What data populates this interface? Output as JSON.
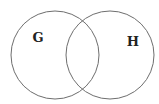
{
  "diagram": {
    "type": "venn",
    "stroke_color": "#6e6e6e",
    "sets": [
      {
        "label": "G",
        "cx": 55,
        "cy": 55,
        "r": 44,
        "label_x": 38,
        "label_y": 42
      },
      {
        "label": "H",
        "cx": 110,
        "cy": 55,
        "r": 44,
        "label_x": 133,
        "label_y": 46
      }
    ]
  }
}
